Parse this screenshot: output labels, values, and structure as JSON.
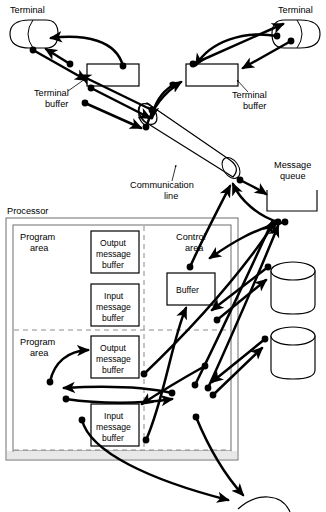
{
  "diagram": {
    "labels": {
      "terminal_left": "Terminal",
      "terminal_right": "Terminal",
      "terminal_buffer_left_line1": "Terminal",
      "terminal_buffer_left_line2": "buffer",
      "terminal_buffer_right_line1": "Terminal",
      "terminal_buffer_right_line2": "buffer",
      "communication_line_line1": "Communication",
      "communication_line_line2": "line",
      "message_queue_line1": "Message",
      "message_queue_line2": "queue",
      "processor": "Processor",
      "program_area_top_line1": "Program",
      "program_area_top_line2": "area",
      "program_area_bottom_line1": "Program",
      "program_area_bottom_line2": "area",
      "control_area_line1": "Control",
      "control_area_line2": "area",
      "buffer": "Buffer",
      "output_message_buffer_1_line1": "Output",
      "output_message_buffer_1_line2": "message",
      "output_message_buffer_1_line3": "buffer",
      "input_message_buffer_1_line1": "Input",
      "input_message_buffer_1_line2": "message",
      "input_message_buffer_1_line3": "buffer",
      "output_message_buffer_2_line1": "Output",
      "output_message_buffer_2_line2": "message",
      "output_message_buffer_2_line3": "buffer",
      "input_message_buffer_2_line1": "Input",
      "input_message_buffer_2_line2": "message",
      "input_message_buffer_2_line3": "buffer"
    },
    "colors": {
      "stroke": "#000000",
      "background": "#ffffff",
      "shaded_band": "#e8e8e8",
      "dashed_divider": "#8a8a8a",
      "outer_box": "#6f6f6f"
    },
    "components": [
      {
        "name": "terminal-left",
        "shape": "terminal-bullet",
        "x": 8,
        "y": 20,
        "w": 48,
        "h": 28
      },
      {
        "name": "terminal-right",
        "shape": "terminal-bullet-mirrored",
        "x": 274,
        "y": 20,
        "w": 48,
        "h": 28
      },
      {
        "name": "terminal-buffer-left",
        "shape": "rectangle",
        "x": 87,
        "y": 64,
        "w": 52,
        "h": 22
      },
      {
        "name": "terminal-buffer-right",
        "shape": "rectangle",
        "x": 186,
        "y": 64,
        "w": 52,
        "h": 22
      },
      {
        "name": "communication-line",
        "shape": "cylinder-3d-diagonal"
      },
      {
        "name": "message-queue",
        "shape": "open-top-container",
        "x": 267,
        "y": 190,
        "w": 50,
        "h": 22
      },
      {
        "name": "processor",
        "shape": "rectangle-outline",
        "x": 6,
        "y": 218,
        "w": 232,
        "h": 242
      },
      {
        "name": "control-buffer",
        "shape": "rectangle",
        "x": 167,
        "y": 273,
        "w": 48,
        "h": 32
      },
      {
        "name": "disk-upper",
        "shape": "cylinder",
        "x": 271,
        "y": 262,
        "w": 44,
        "h": 52
      },
      {
        "name": "disk-lower",
        "shape": "cylinder",
        "x": 271,
        "y": 327,
        "w": 44,
        "h": 52
      }
    ],
    "connector_count": 24
  }
}
